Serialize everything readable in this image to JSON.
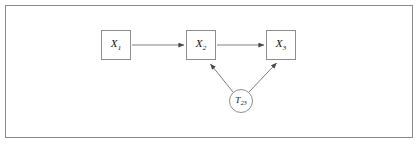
{
  "figure": {
    "background_color": "#ffffff",
    "border_color": "#8a8a8a",
    "stroke_color": "#6f6f6f",
    "text_color": "#111111"
  },
  "nodes": [
    {
      "id": "x1",
      "shape": "square",
      "symbol": "X",
      "subscript": "1",
      "label": "X1",
      "x": 101,
      "y": 30,
      "size": 30
    },
    {
      "id": "x2",
      "shape": "square",
      "symbol": "X",
      "subscript": "2",
      "label": "X2",
      "x": 186,
      "y": 30,
      "size": 30
    },
    {
      "id": "x3",
      "shape": "square",
      "symbol": "X",
      "subscript": "3",
      "label": "X3",
      "x": 266,
      "y": 30,
      "size": 30
    },
    {
      "id": "t23",
      "shape": "circle",
      "symbol": "T",
      "subscript": "23",
      "label": "T23",
      "cx": 241,
      "cy": 101,
      "radius": 12
    }
  ],
  "edges": [
    {
      "id": "x1-to-x2",
      "from": "x1",
      "to": "x2",
      "label": "",
      "arrow": "to"
    },
    {
      "id": "x2-to-x3",
      "from": "x2",
      "to": "x3",
      "label": "",
      "arrow": "to"
    },
    {
      "id": "t23-to-x2",
      "from": "t23",
      "to": "x2",
      "label": "",
      "arrow": "to"
    },
    {
      "id": "t23-to-x3",
      "from": "t23",
      "to": "x3",
      "label": "",
      "arrow": "to"
    }
  ]
}
